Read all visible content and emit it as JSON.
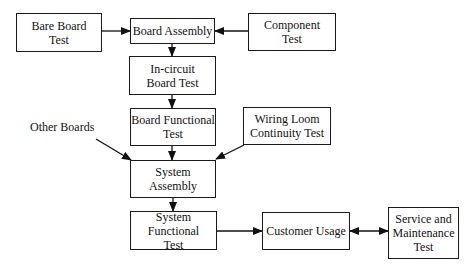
{
  "diagram": {
    "type": "flowchart",
    "nodes": {
      "bare_board_test": "Bare Board\nTest",
      "board_assembly": "Board Assembly",
      "component_test": "Component\nTest",
      "in_circuit_board_test": "In-circuit\nBoard Test",
      "board_functional_test": "Board Functional\nTest",
      "wiring_loom_continuity_test": "Wiring Loom\nContinuity Test",
      "system_assembly": "System\nAssembly",
      "system_functional_test": "System Functional\nTest",
      "customer_usage": "Customer Usage",
      "service_and_maintenance_test": "Service and\nMaintenance\nTest"
    },
    "labels": {
      "other_boards": "Other Boards"
    },
    "edges": [
      {
        "from": "Bare Board Test",
        "to": "Board Assembly"
      },
      {
        "from": "Component Test",
        "to": "Board Assembly"
      },
      {
        "from": "Board Assembly",
        "to": "In-circuit Board Test"
      },
      {
        "from": "In-circuit Board Test",
        "to": "Board Functional Test"
      },
      {
        "from": "Board Functional Test",
        "to": "System Assembly"
      },
      {
        "from": "Other Boards",
        "to": "System Assembly"
      },
      {
        "from": "Wiring Loom Continuity Test",
        "to": "System Assembly"
      },
      {
        "from": "System Assembly",
        "to": "System Functional Test"
      },
      {
        "from": "System Functional Test",
        "to": "Customer Usage"
      },
      {
        "from": "Customer Usage",
        "to": "Service and Maintenance Test",
        "bidirectional": true
      }
    ]
  }
}
